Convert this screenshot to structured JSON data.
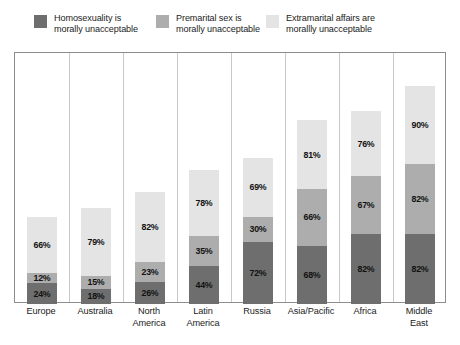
{
  "legend": {
    "entries": [
      {
        "label": "Homosexuality is\nmorally unacceptable",
        "color": "#6e6e6e",
        "icon": "legend-swatch-dark"
      },
      {
        "label": "Premarital sex is\nmorally unacceptable",
        "color": "#adadad",
        "icon": "legend-swatch-mid"
      },
      {
        "label": "Extramarital affairs are\nmorallly unacceptable",
        "color": "#e4e4e4",
        "icon": "legend-swatch-light"
      }
    ]
  },
  "colors": {
    "series_dark": "#6e6e6e",
    "series_mid": "#adadad",
    "series_light": "#e4e4e4",
    "frame_border": "#8d8d8d",
    "grid_separator": "#c9c9c9",
    "label_text": "#121212",
    "background": "#ffffff"
  },
  "chart_data": {
    "type": "bar",
    "stacked": true,
    "title": "",
    "subtitle": "",
    "xlabel": "",
    "ylabel": "",
    "ylim": [
      0,
      293
    ],
    "grid": "vertical-separators-only",
    "legend_position": "top",
    "value_suffix": "%",
    "categories": [
      "Europe",
      "Australia",
      "North\nAmerica",
      "Latin\nAmerica",
      "Russia",
      "Asia/Pacific",
      "Africa",
      "Middle\nEast"
    ],
    "series": [
      {
        "name": "Homosexuality is morally unacceptable",
        "color": "#6e6e6e",
        "values": [
          24,
          18,
          26,
          44,
          72,
          68,
          82,
          82
        ],
        "labels": [
          "24%",
          "18%",
          "26%",
          "44%",
          "72%",
          "68%",
          "82%",
          "82%"
        ]
      },
      {
        "name": "Premarital sex is morally unacceptable",
        "color": "#adadad",
        "values": [
          12,
          15,
          23,
          35,
          30,
          66,
          67,
          82
        ],
        "labels": [
          "12%",
          "15%",
          "23%",
          "35%",
          "30%",
          "66%",
          "67%",
          "82%"
        ]
      },
      {
        "name": "Extramarital affairs are morallly unacceptable",
        "color": "#e4e4e4",
        "values": [
          66,
          79,
          82,
          78,
          69,
          81,
          76,
          90
        ],
        "labels": [
          "66%",
          "79%",
          "82%",
          "78%",
          "69%",
          "81%",
          "76%",
          "90%"
        ]
      }
    ],
    "stack_totals": [
      102,
      112,
      131,
      157,
      171,
      215,
      225,
      254
    ]
  }
}
